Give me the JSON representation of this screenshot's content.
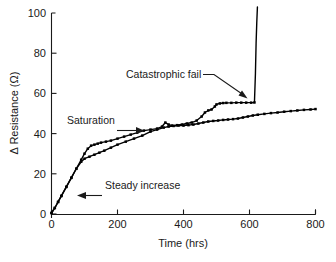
{
  "chart_data": {
    "type": "line",
    "title": "",
    "xlabel": "Time (hrs)",
    "ylabel": "Δ Resistance (Ω)",
    "xlim": [
      0,
      800
    ],
    "ylim": [
      0,
      100
    ],
    "xticks": [
      0,
      200,
      400,
      600,
      800
    ],
    "yticks": [
      0,
      20,
      40,
      60,
      80,
      100
    ],
    "xtick_labels": [
      "0",
      "200",
      "400",
      "600",
      "800"
    ],
    "ytick_labels": [
      "0",
      "20",
      "40",
      "60",
      "80",
      "100"
    ],
    "grid": false,
    "legend": "none",
    "series": [
      {
        "name": "Sample A (catastrophic fail)",
        "x": [
          0,
          10,
          20,
          30,
          45,
          60,
          75,
          90,
          100,
          110,
          120,
          130,
          140,
          150,
          165,
          180,
          200,
          220,
          240,
          260,
          280,
          300,
          320,
          335,
          345,
          355,
          365,
          380,
          395,
          410,
          425,
          440,
          455,
          465,
          475,
          485,
          495,
          500,
          510,
          520,
          530,
          545,
          560,
          575,
          590,
          605,
          615,
          618,
          620,
          622,
          624
        ],
        "y": [
          0.5,
          3,
          6,
          9,
          13.5,
          18,
          22.5,
          27,
          30,
          32.5,
          34,
          34.5,
          35,
          35.5,
          36,
          36.5,
          37.5,
          38.5,
          39.5,
          40.5,
          41.5,
          42,
          42.5,
          43.5,
          45.5,
          44.5,
          44,
          44.2,
          44.5,
          45,
          45.5,
          46.5,
          48.5,
          50.5,
          51.5,
          52,
          53.5,
          54.5,
          55,
          55.2,
          55.3,
          55.3,
          55.4,
          55.4,
          55.4,
          55.4,
          55.5,
          70,
          85,
          95,
          103
        ]
      },
      {
        "name": "Sample B (steady increase / saturation)",
        "x": [
          0,
          10,
          20,
          30,
          45,
          60,
          75,
          90,
          100,
          115,
          130,
          145,
          160,
          180,
          200,
          225,
          250,
          275,
          300,
          320,
          340,
          355,
          370,
          385,
          400,
          415,
          430,
          445,
          460,
          475,
          490,
          505,
          520,
          535,
          550,
          565,
          580,
          595,
          610,
          625,
          645,
          665,
          685,
          705,
          725,
          745,
          765,
          785,
          800
        ],
        "y": [
          0.5,
          3,
          6,
          9,
          13.5,
          18,
          22.5,
          26,
          27.5,
          28.5,
          29.5,
          30.5,
          31.5,
          33,
          34.5,
          36,
          37.5,
          39,
          41,
          42,
          43,
          43.5,
          43.8,
          44,
          44,
          44.2,
          44.5,
          45,
          45.5,
          46,
          46.3,
          46.5,
          46.8,
          47,
          47.2,
          47.5,
          48,
          48.5,
          49,
          49.4,
          49.8,
          50.2,
          50.5,
          50.9,
          51.2,
          51.5,
          51.8,
          52,
          52.2
        ]
      }
    ],
    "annotations": [
      {
        "id": "catastrophic-fail",
        "text": "Catastrophic fail",
        "text_x": 215,
        "text_y": 69,
        "arrow_to_x": 600,
        "arrow_to_y": 57
      },
      {
        "id": "saturation",
        "text": "Saturation",
        "text_x": 60,
        "text_y": 51,
        "arrow_to_x": 255,
        "arrow_to_y": 44
      },
      {
        "id": "steady-increase",
        "text": "Steady increase",
        "text_x": 185,
        "text_y": 13,
        "arrow_to_x": 75,
        "arrow_to_y": 12
      }
    ]
  }
}
